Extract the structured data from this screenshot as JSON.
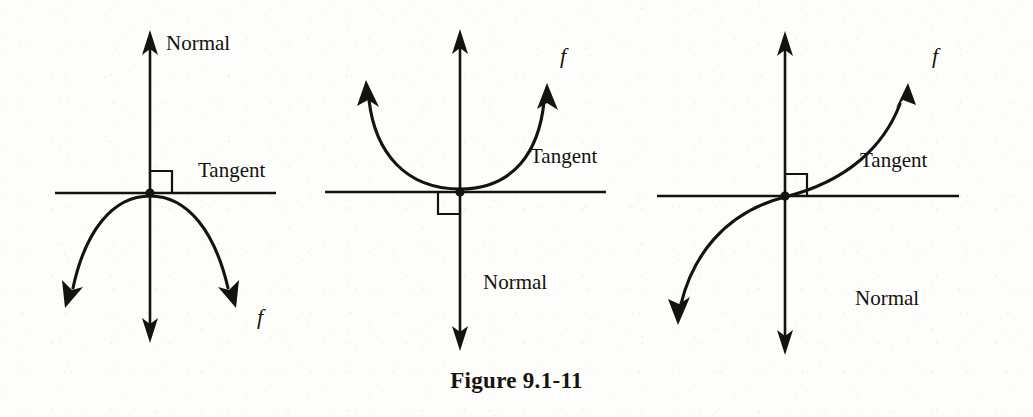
{
  "figure": {
    "caption": "Figure 9.1-11",
    "panels": [
      {
        "id": "panel-concave-down",
        "normal_label": "Normal",
        "tangent_label": "Tangent",
        "function_label": "f",
        "origin": [
          150,
          193
        ],
        "right_angle_quadrant": "upper-right",
        "curve_shape": "concave-down arc below tangent line",
        "normal_axis": {
          "top": [
            150,
            32
          ],
          "bottom": [
            150,
            340
          ]
        },
        "tangent_axis": {
          "left": [
            55,
            193
          ],
          "right": [
            275,
            193
          ]
        },
        "curve_endpoints": [
          [
            65,
            305
          ],
          [
            240,
            305
          ]
        ],
        "label_positions": {
          "normal": [
            166,
            34
          ],
          "tangent": [
            198,
            160
          ],
          "f": [
            258,
            305
          ]
        }
      },
      {
        "id": "panel-concave-up",
        "normal_label": "Normal",
        "tangent_label": "Tangent",
        "function_label": "f",
        "origin": [
          460,
          192
        ],
        "right_angle_quadrant": "lower-left",
        "curve_shape": "concave-up parabola tangent to line at origin",
        "normal_axis": {
          "top": [
            460,
            30
          ],
          "bottom": [
            460,
            348
          ]
        },
        "tangent_axis": {
          "left": [
            325,
            192
          ],
          "right": [
            605,
            192
          ]
        },
        "curve_endpoints": [
          [
            366,
            82
          ],
          [
            547,
            85
          ]
        ],
        "label_positions": {
          "normal": [
            483,
            272
          ],
          "tangent": [
            530,
            146
          ],
          "f": [
            560,
            45
          ]
        }
      },
      {
        "id": "panel-inflection",
        "normal_label": "Normal",
        "tangent_label": "Tangent",
        "function_label": "f",
        "origin": [
          785,
          196
        ],
        "right_angle_quadrant": "upper-right",
        "curve_shape": "cubic inflection crossing tangent line at origin",
        "normal_axis": {
          "top": [
            785,
            32
          ],
          "bottom": [
            785,
            352
          ]
        },
        "tangent_axis": {
          "left": [
            657,
            196
          ],
          "right": [
            958,
            196
          ]
        },
        "curve_endpoints": [
          [
            678,
            323
          ],
          [
            910,
            85
          ]
        ],
        "label_positions": {
          "normal": [
            855,
            288
          ],
          "tangent": [
            860,
            150
          ],
          "f": [
            932,
            45
          ]
        }
      }
    ]
  },
  "colors": {
    "ink": "#15130f",
    "paper": "#fdfdfb"
  }
}
